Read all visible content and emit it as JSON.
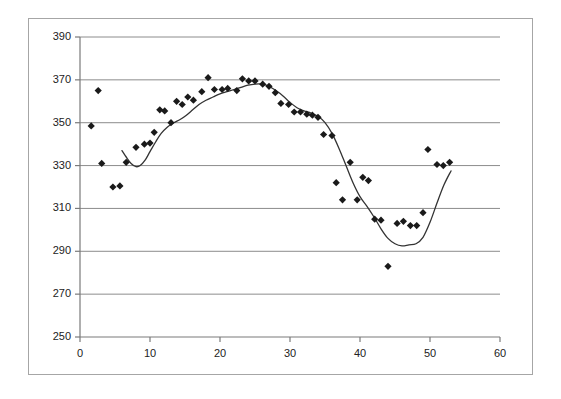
{
  "chart_data": {
    "type": "scatter",
    "title": "",
    "subtitle": "",
    "xlabel": "",
    "ylabel": "",
    "xlim": [
      0,
      60
    ],
    "ylim": [
      250,
      390
    ],
    "x_ticks": [
      0,
      10,
      20,
      30,
      40,
      50,
      60
    ],
    "y_ticks": [
      250,
      270,
      290,
      310,
      330,
      350,
      370,
      390
    ],
    "grid": "horizontal",
    "legend": "none",
    "marker": "diamond",
    "marker_color": "#1a1a1a",
    "line_color": "#333333",
    "series": [
      {
        "name": "observations",
        "type": "scatter",
        "points": [
          [
            1.6,
            348.5
          ],
          [
            2.6,
            365.0
          ],
          [
            3.1,
            331.0
          ],
          [
            4.7,
            320.0
          ],
          [
            5.7,
            320.5
          ],
          [
            6.6,
            331.5
          ],
          [
            8.0,
            338.5
          ],
          [
            9.2,
            340.0
          ],
          [
            10.0,
            340.5
          ],
          [
            10.6,
            345.5
          ],
          [
            11.4,
            356.0
          ],
          [
            12.1,
            355.5
          ],
          [
            13.0,
            350.0
          ],
          [
            13.8,
            360.0
          ],
          [
            14.6,
            358.5
          ],
          [
            15.4,
            362.0
          ],
          [
            16.2,
            360.5
          ],
          [
            17.4,
            364.5
          ],
          [
            18.3,
            371.0
          ],
          [
            19.2,
            365.5
          ],
          [
            20.3,
            365.5
          ],
          [
            21.1,
            366.0
          ],
          [
            22.4,
            365.0
          ],
          [
            23.2,
            370.5
          ],
          [
            24.1,
            369.5
          ],
          [
            25.0,
            369.5
          ],
          [
            26.1,
            368.0
          ],
          [
            27.0,
            367.0
          ],
          [
            27.9,
            364.0
          ],
          [
            28.7,
            359.0
          ],
          [
            29.8,
            358.5
          ],
          [
            30.6,
            355.0
          ],
          [
            31.5,
            355.0
          ],
          [
            32.4,
            354.0
          ],
          [
            33.2,
            353.5
          ],
          [
            34.0,
            352.5
          ],
          [
            34.8,
            344.5
          ],
          [
            36.0,
            344.0
          ],
          [
            36.6,
            322.0
          ],
          [
            37.5,
            314.0
          ],
          [
            38.6,
            331.5
          ],
          [
            39.6,
            314.0
          ],
          [
            40.4,
            324.5
          ],
          [
            41.2,
            323.0
          ],
          [
            42.1,
            305.0
          ],
          [
            43.0,
            304.5
          ],
          [
            44.0,
            283.0
          ],
          [
            45.3,
            303.0
          ],
          [
            46.2,
            304.0
          ],
          [
            47.2,
            302.0
          ],
          [
            48.1,
            302.0
          ],
          [
            49.0,
            308.0
          ],
          [
            49.7,
            337.5
          ],
          [
            51.0,
            330.5
          ],
          [
            51.9,
            330.0
          ],
          [
            52.8,
            331.5
          ]
        ]
      },
      {
        "name": "trend",
        "type": "line",
        "points": [
          [
            6.0,
            337.0
          ],
          [
            6.6,
            334.0
          ],
          [
            7.3,
            331.0
          ],
          [
            8.0,
            329.5
          ],
          [
            8.6,
            330.0
          ],
          [
            9.3,
            332.5
          ],
          [
            10.0,
            336.5
          ],
          [
            10.8,
            341.0
          ],
          [
            11.6,
            345.0
          ],
          [
            12.5,
            348.0
          ],
          [
            13.4,
            350.0
          ],
          [
            14.3,
            351.5
          ],
          [
            15.2,
            353.5
          ],
          [
            16.1,
            356.0
          ],
          [
            17.0,
            358.5
          ],
          [
            18.0,
            360.5
          ],
          [
            19.0,
            362.0
          ],
          [
            20.0,
            363.5
          ],
          [
            21.0,
            364.5
          ],
          [
            22.0,
            365.5
          ],
          [
            23.0,
            366.5
          ],
          [
            24.0,
            367.5
          ],
          [
            25.0,
            368.0
          ],
          [
            26.0,
            368.0
          ],
          [
            27.0,
            367.0
          ],
          [
            28.0,
            365.0
          ],
          [
            29.0,
            362.5
          ],
          [
            30.0,
            359.5
          ],
          [
            31.0,
            357.0
          ],
          [
            32.0,
            355.5
          ],
          [
            33.0,
            354.5
          ],
          [
            34.0,
            353.0
          ],
          [
            35.0,
            350.0
          ],
          [
            36.0,
            345.0
          ],
          [
            37.0,
            338.0
          ],
          [
            38.0,
            330.0
          ],
          [
            39.0,
            322.0
          ],
          [
            40.0,
            315.5
          ],
          [
            41.0,
            311.0
          ],
          [
            42.0,
            306.0
          ],
          [
            43.0,
            300.5
          ],
          [
            44.0,
            296.0
          ],
          [
            45.0,
            293.5
          ],
          [
            46.0,
            292.5
          ],
          [
            47.0,
            293.0
          ],
          [
            48.0,
            293.5
          ],
          [
            49.0,
            296.5
          ],
          [
            50.0,
            303.5
          ],
          [
            51.0,
            312.5
          ],
          [
            52.0,
            321.0
          ],
          [
            53.0,
            327.5
          ]
        ]
      }
    ]
  },
  "axes": {
    "y_labels": [
      "390",
      "370",
      "350",
      "330",
      "310",
      "290",
      "270",
      "250"
    ],
    "x_labels": [
      "0",
      "10",
      "20",
      "30",
      "40",
      "50",
      "60"
    ]
  }
}
